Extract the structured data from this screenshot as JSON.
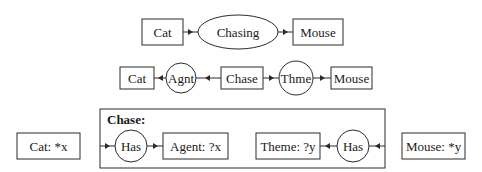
{
  "diagram": {
    "type": "conceptual-graphs",
    "row1": {
      "concept_left": "Cat",
      "relation": "Chasing",
      "concept_right": "Mouse"
    },
    "row2": {
      "concept_left": "Cat",
      "relation_left": "Agnt",
      "concept_center": "Chase",
      "relation_right": "Thme",
      "concept_right": "Mouse"
    },
    "row3": {
      "outer_concept": "Cat: *x",
      "context_label": "Chase:",
      "has_left": "Has",
      "agent": "Agent: ?x",
      "theme": "Theme: ?y",
      "has_right": "Has",
      "outer_mouse": "Mouse: *y"
    }
  }
}
